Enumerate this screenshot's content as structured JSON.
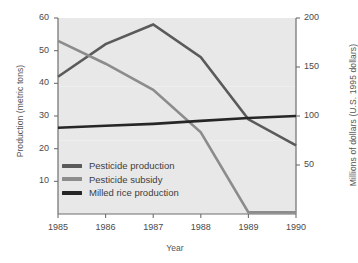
{
  "chart_data": {
    "type": "line",
    "title": "",
    "xlabel": "Year",
    "ylabel": "Production (metric tons)",
    "ylabel_right": "Millions of dollars (U.S. 1995 dollars)",
    "categories": [
      "1985",
      "1986",
      "1987",
      "1988",
      "1989",
      "1990"
    ],
    "x": [
      1985,
      1986,
      1987,
      1988,
      1989,
      1990
    ],
    "xlim": [
      1985,
      1990
    ],
    "ylim": [
      0,
      60
    ],
    "ylim_right": [
      0,
      200
    ],
    "yticks": [
      "10",
      "20",
      "30",
      "40",
      "50",
      "60"
    ],
    "ytick_values": [
      10,
      20,
      30,
      40,
      50,
      60
    ],
    "yticks_right": [
      "50",
      "100",
      "150",
      "200"
    ],
    "ytick_values_right": [
      50,
      100,
      150,
      200
    ],
    "grid": false,
    "legend_position": "inside-lower-left",
    "plot_background": "#e8e8e8",
    "series": [
      {
        "name": "Pesticide production",
        "axis": "left",
        "color": "#5a5a5a",
        "values": [
          42,
          52,
          58,
          48,
          29,
          21
        ]
      },
      {
        "name": "Pesticide subsidy",
        "axis": "left",
        "color": "#8c8c8c",
        "values": [
          53,
          46,
          38,
          25,
          0.5,
          0.5
        ]
      },
      {
        "name": "Milled rice production",
        "axis": "right",
        "color": "#262626",
        "values": [
          88,
          90,
          92,
          95,
          98,
          100
        ]
      }
    ]
  },
  "axes": {
    "left_title": "Production (metric tons)",
    "right_title": "Millions of dollars (U.S. 1995 dollars)",
    "x_title": "Year"
  },
  "legend": {
    "items": [
      {
        "label": "Pesticide production",
        "color": "#5a5a5a"
      },
      {
        "label": "Pesticide subsidy",
        "color": "#8c8c8c"
      },
      {
        "label": "Milled rice production",
        "color": "#262626"
      }
    ]
  }
}
